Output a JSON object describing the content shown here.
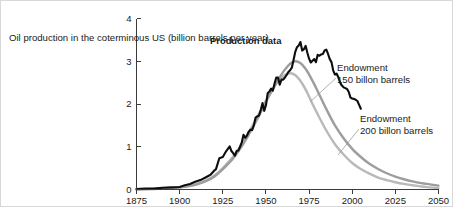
{
  "chart_data": {
    "type": "line",
    "title": "",
    "xlabel": "",
    "ylabel": "Oil production in the coterminous US (billion barrels per year)",
    "ylabel_lines": [
      "Oil production in the",
      "coterminous US",
      "(billion barrels per year)"
    ],
    "xlim": [
      1875,
      2050
    ],
    "ylim": [
      0,
      4
    ],
    "x_ticks": [
      1875,
      1900,
      1925,
      1950,
      1975,
      2000,
      2025,
      2050
    ],
    "x_tick_labels": [
      "1875",
      "1900",
      "1925",
      "1950",
      "1975",
      "2000",
      "2025",
      "2050"
    ],
    "y_ticks": [
      0,
      1,
      2,
      3,
      4
    ],
    "y_tick_labels": [
      "0",
      "1",
      "2",
      "3",
      "4"
    ],
    "grid": false,
    "legend_position": "inline-annotations",
    "annotations": [
      {
        "name": "production-data",
        "lines": [
          "Production data"
        ],
        "bold": true
      },
      {
        "name": "endowment-150",
        "lines": [
          "Endowment",
          "150 billon barrels"
        ],
        "bold": false
      },
      {
        "name": "endowment-200",
        "lines": [
          "Endowment",
          "200 billon barrels"
        ],
        "bold": false
      }
    ],
    "colors": {
      "production": "#0d0d0d",
      "endowment_150": "#9d9d9d",
      "endowment_200": "#b9b9b9",
      "axis": "#3c3c3c",
      "text": "#1a1a1a",
      "background": "#ffffff"
    },
    "series": [
      {
        "name": "Production data",
        "color": "#0d0d0d",
        "x": [
          1875,
          1880,
          1885,
          1890,
          1895,
          1900,
          1903,
          1906,
          1909,
          1912,
          1915,
          1918,
          1920,
          1921,
          1923,
          1925,
          1927,
          1929,
          1930,
          1931,
          1932,
          1933,
          1934,
          1935,
          1936,
          1937,
          1938,
          1939,
          1940,
          1941,
          1942,
          1943,
          1944,
          1945,
          1946,
          1947,
          1948,
          1949,
          1950,
          1951,
          1952,
          1953,
          1954,
          1955,
          1956,
          1957,
          1958,
          1959,
          1960,
          1961,
          1962,
          1963,
          1964,
          1965,
          1966,
          1967,
          1968,
          1969,
          1970,
          1971,
          1972,
          1973,
          1974,
          1975,
          1976,
          1977,
          1978,
          1979,
          1980,
          1981,
          1982,
          1983,
          1984,
          1985,
          1986,
          1987,
          1988,
          1989,
          1990,
          1991,
          1992,
          1993,
          1994,
          1995,
          1996,
          1997,
          1998,
          1999,
          2000,
          2001,
          2002,
          2003,
          2004,
          2005
        ],
        "y": [
          0.01,
          0.02,
          0.02,
          0.04,
          0.05,
          0.06,
          0.1,
          0.13,
          0.18,
          0.22,
          0.28,
          0.35,
          0.44,
          0.47,
          0.73,
          0.76,
          0.9,
          1.01,
          0.9,
          0.85,
          0.79,
          0.9,
          0.91,
          1.0,
          1.1,
          1.28,
          1.21,
          1.26,
          1.35,
          1.4,
          1.39,
          1.5,
          1.68,
          1.71,
          1.73,
          1.86,
          2.02,
          1.84,
          1.97,
          2.25,
          2.29,
          2.36,
          2.31,
          2.48,
          2.62,
          2.62,
          2.45,
          2.57,
          2.57,
          2.62,
          2.68,
          2.75,
          2.79,
          2.85,
          3.03,
          3.22,
          3.33,
          3.37,
          3.45,
          3.25,
          3.28,
          3.36,
          3.2,
          3.06,
          2.97,
          3.01,
          3.05,
          2.98,
          3.15,
          3.13,
          3.16,
          3.17,
          3.25,
          3.27,
          3.17,
          3.05,
          2.98,
          2.78,
          2.69,
          2.71,
          2.62,
          2.5,
          2.43,
          2.39,
          2.37,
          2.35,
          2.28,
          2.15,
          2.13,
          2.12,
          2.1,
          2.07,
          1.98,
          1.89
        ]
      },
      {
        "name": "Endowment 150 billon barrels",
        "color": "#9d9d9d",
        "peak_year": 1967,
        "peak_value": 3.0,
        "x": [
          1875,
          1890,
          1900,
          1910,
          1920,
          1930,
          1935,
          1940,
          1945,
          1950,
          1955,
          1960,
          1963,
          1965,
          1967,
          1969,
          1971,
          1974,
          1977,
          1980,
          1985,
          1990,
          1995,
          2000,
          2005,
          2010,
          2015,
          2020,
          2025,
          2030,
          2035,
          2040,
          2045,
          2050
        ],
        "y": [
          0.0,
          0.02,
          0.05,
          0.12,
          0.3,
          0.68,
          0.95,
          1.28,
          1.65,
          2.05,
          2.42,
          2.75,
          2.9,
          2.97,
          3.0,
          2.98,
          2.92,
          2.76,
          2.54,
          2.3,
          1.88,
          1.5,
          1.2,
          0.95,
          0.76,
          0.6,
          0.48,
          0.38,
          0.3,
          0.24,
          0.19,
          0.15,
          0.12,
          0.09
        ]
      },
      {
        "name": "Endowment 200 billon barrels",
        "color": "#b9b9b9",
        "peak_year": 1964,
        "peak_value": 2.72,
        "x": [
          1875,
          1890,
          1900,
          1910,
          1920,
          1930,
          1935,
          1940,
          1945,
          1950,
          1955,
          1958,
          1961,
          1964,
          1966,
          1968,
          1971,
          1974,
          1977,
          1980,
          1985,
          1990,
          1995,
          2000,
          2005,
          2010,
          2015,
          2020,
          2025,
          2030,
          2035,
          2040,
          2045,
          2050
        ],
        "y": [
          0.0,
          0.02,
          0.05,
          0.13,
          0.32,
          0.72,
          1.0,
          1.33,
          1.7,
          2.08,
          2.42,
          2.58,
          2.68,
          2.72,
          2.7,
          2.64,
          2.48,
          2.26,
          2.0,
          1.76,
          1.38,
          1.06,
          0.82,
          0.62,
          0.48,
          0.37,
          0.28,
          0.22,
          0.17,
          0.13,
          0.1,
          0.07,
          0.05,
          0.03
        ]
      }
    ]
  }
}
